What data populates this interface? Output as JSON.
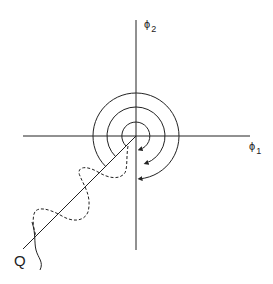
{
  "diagram": {
    "axes": {
      "horizontal_label": {
        "symbol": "ϕ",
        "subscript": "1"
      },
      "vertical_label": {
        "symbol": "ϕ",
        "subscript": "2"
      }
    },
    "center": [
      136,
      136
    ],
    "circles_radii": [
      14,
      29,
      43
    ],
    "path_label": "Q",
    "colors": {
      "line": "#222222",
      "background": "#ffffff"
    }
  }
}
